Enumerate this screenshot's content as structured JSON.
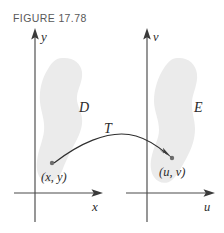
{
  "figure": {
    "caption": "FIGURE 17.78",
    "caption_color": "#58585a",
    "background_color": "#ffffff",
    "region_fill_color": "#ebebeb",
    "axis_color": "#4a4a4a",
    "curve_color": "#2f2f2f"
  },
  "left_plane": {
    "vertical_axis_label": "y",
    "horizontal_axis_label": "x",
    "region_label": "D",
    "point_label": "(x, y)"
  },
  "right_plane": {
    "vertical_axis_label": "v",
    "horizontal_axis_label": "u",
    "region_label": "E",
    "point_label": "(u, v)"
  },
  "transformation": {
    "label": "T"
  }
}
